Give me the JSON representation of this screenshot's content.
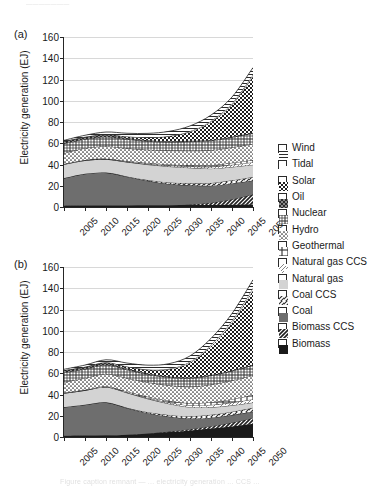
{
  "artifacts": {
    "top": "———————",
    "bottom": "Figure caption remnant — ... electricity generation ... CCS ..."
  },
  "axis": {
    "ylabel": "Electricity generation (EJ)",
    "yticks": [
      0,
      20,
      40,
      60,
      80,
      100,
      120,
      140,
      160
    ],
    "ylim": [
      0,
      160
    ],
    "xticks": [
      "2005",
      "2010",
      "2015",
      "2020",
      "2025",
      "2030",
      "2035",
      "2040",
      "2045",
      "2050"
    ],
    "xlim": [
      2005,
      2050
    ]
  },
  "panels": [
    {
      "tag": "(a)"
    },
    {
      "tag": "(b)"
    }
  ],
  "legend": {
    "position": "right",
    "items": [
      {
        "label": "Wind",
        "pattern": "horizontal-lines",
        "color": "#ffffff"
      },
      {
        "label": "Tidal",
        "pattern": "blank",
        "color": "#ffffff"
      },
      {
        "label": "Solar",
        "pattern": "dense-checker",
        "color": "#ffffff"
      },
      {
        "label": "Oil",
        "pattern": "dark-dotted",
        "color": "#2b2b2b"
      },
      {
        "label": "Nuclear",
        "pattern": "grid-squares",
        "color": "#ffffff"
      },
      {
        "label": "Hydro",
        "pattern": "fine-dotted",
        "color": "#ffffff"
      },
      {
        "label": "Geothermal",
        "pattern": "cross-bars",
        "color": "#ffffff"
      },
      {
        "label": "Natural gas CCS",
        "pattern": "light-diagonal",
        "color": "#ffffff"
      },
      {
        "label": "Natural gas",
        "pattern": "light-gray",
        "color": "#d3d3d3"
      },
      {
        "label": "Coal CCS",
        "pattern": "diagonal-hatch",
        "color": "#ffffff"
      },
      {
        "label": "Coal",
        "pattern": "solid-gray",
        "color": "#6e6e6e"
      },
      {
        "label": "Biomass CCS",
        "pattern": "bold-diagonal",
        "color": "#ffffff"
      },
      {
        "label": "Biomass",
        "pattern": "solid-black",
        "color": "#1a1a1a"
      }
    ]
  },
  "chart_data": {
    "type": "area",
    "stacked": true,
    "title": "",
    "xlabel": "",
    "ylabel": "Electricity generation (EJ)",
    "ylim": [
      0,
      160
    ],
    "grid": true,
    "x": [
      2005,
      2010,
      2015,
      2020,
      2025,
      2030,
      2035,
      2040,
      2045,
      2050
    ],
    "panels": [
      {
        "tag": "(a)",
        "totals": [
          63,
          66,
          68,
          66,
          65,
          67,
          72,
          82,
          100,
          130
        ],
        "series": [
          {
            "name": "Biomass",
            "values": [
              1.2,
              1.3,
              1.4,
              1.5,
              1.6,
              1.7,
              1.8,
              2.0,
              2.2,
              2.4
            ]
          },
          {
            "name": "Biomass CCS",
            "values": [
              0,
              0,
              0,
              0,
              0,
              0,
              0.6,
              2.0,
              5.0,
              9.5
            ]
          },
          {
            "name": "Coal",
            "values": [
              26,
              30,
              31,
              27,
              23,
              20,
              18,
              16,
              15,
              13
            ]
          },
          {
            "name": "Coal CCS",
            "values": [
              0,
              0,
              0,
              0.3,
              0.8,
              1.4,
              2.0,
              2.6,
              3.0,
              3.4
            ]
          },
          {
            "name": "Natural gas",
            "values": [
              13,
              12.5,
              12.5,
              13.5,
              14.5,
              15.0,
              14.5,
              13.5,
              12.5,
              11.5
            ]
          },
          {
            "name": "Natural gas CCS",
            "values": [
              0,
              0,
              0,
              0.2,
              0.5,
              0.9,
              1.3,
              1.7,
              2.0,
              2.3
            ]
          },
          {
            "name": "Geothermal",
            "values": [
              0.4,
              0.5,
              0.6,
              0.7,
              0.9,
              1.1,
              1.3,
              1.6,
              1.9,
              2.2
            ]
          },
          {
            "name": "Hydro",
            "values": [
              10,
              11,
              11.5,
              12,
              12.5,
              13,
              13.5,
              14,
              14.5,
              15
            ]
          },
          {
            "name": "Nuclear",
            "values": [
              9,
              8.5,
              9.0,
              8.5,
              8.0,
              8.0,
              8.5,
              9.0,
              9.5,
              10
            ]
          },
          {
            "name": "Oil",
            "values": [
              2.2,
              1.9,
              1.6,
              1.3,
              1.1,
              0.9,
              0.8,
              0.7,
              0.6,
              0.5
            ]
          },
          {
            "name": "Solar",
            "values": [
              0.1,
              0.3,
              0.6,
              1.2,
              2.4,
              4.5,
              8.5,
              17,
              30,
              53
            ]
          },
          {
            "name": "Tidal",
            "values": [
              0.05,
              0.1,
              0.15,
              0.2,
              0.3,
              0.4,
              0.6,
              0.9,
              1.2,
              1.6
            ]
          },
          {
            "name": "Wind",
            "values": [
              0.8,
              1.4,
              2.2,
              3.0,
              3.7,
              4.3,
              4.9,
              5.5,
              6.1,
              6.8
            ]
          }
        ]
      },
      {
        "tag": "(b)",
        "totals": [
          64,
          68,
          70,
          67,
          66,
          68,
          76,
          90,
          115,
          152
        ],
        "series": [
          {
            "name": "Biomass",
            "values": [
              1.2,
              1.4,
              1.6,
              2.2,
              3.2,
              4.6,
              6.2,
              8.0,
              10.0,
              12.5
            ]
          },
          {
            "name": "Biomass CCS",
            "values": [
              0,
              0,
              0,
              0,
              0.2,
              0.6,
              1.2,
              2.2,
              3.6,
              5.4
            ]
          },
          {
            "name": "Coal",
            "values": [
              27,
              29,
              31,
              25,
              19,
              14,
              10,
              8,
              7,
              6
            ]
          },
          {
            "name": "Coal CCS",
            "values": [
              0,
              0,
              0,
              0.4,
              1.0,
              1.6,
              2.2,
              2.8,
              3.2,
              3.6
            ]
          },
          {
            "name": "Natural gas",
            "values": [
              13,
              13.5,
              14.5,
              14.0,
              12.5,
              10.5,
              8.5,
              7.0,
              6.0,
              5.0
            ]
          },
          {
            "name": "Natural gas CCS",
            "values": [
              0,
              0,
              0,
              0.3,
              0.7,
              1.2,
              1.7,
              2.2,
              2.6,
              3.0
            ]
          },
          {
            "name": "Geothermal",
            "values": [
              0.4,
              0.5,
              0.7,
              0.9,
              1.2,
              1.6,
              2.0,
              2.6,
              3.2,
              4.0
            ]
          },
          {
            "name": "Hydro",
            "values": [
              10,
              11,
              11.5,
              12.5,
              13.5,
              14.5,
              15.5,
              16.5,
              17.5,
              18.5
            ]
          },
          {
            "name": "Nuclear",
            "values": [
              9,
              8.5,
              8.5,
              8.0,
              7.5,
              7.5,
              8.0,
              8.5,
              9.0,
              9.5
            ]
          },
          {
            "name": "Oil",
            "values": [
              2.2,
              1.8,
              1.5,
              1.2,
              1.0,
              0.8,
              0.7,
              0.6,
              0.5,
              0.4
            ]
          },
          {
            "name": "Solar",
            "values": [
              0.1,
              0.4,
              0.8,
              1.6,
              3.4,
              6.8,
              14.0,
              27.0,
              45.0,
              70.0
            ]
          },
          {
            "name": "Tidal",
            "values": [
              0.05,
              0.1,
              0.2,
              0.3,
              0.4,
              0.6,
              0.9,
              1.3,
              1.8,
              2.4
            ]
          },
          {
            "name": "Wind",
            "values": [
              0.8,
              1.5,
              2.4,
              3.2,
              4.0,
              4.7,
              5.4,
              6.1,
              6.8,
              7.6
            ]
          }
        ]
      }
    ]
  }
}
